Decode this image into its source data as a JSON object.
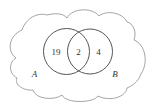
{
  "diagram": {
    "type": "venn",
    "universe_shape": "cloud",
    "colors": {
      "cloud_stroke": "#9a9a9a",
      "circle_stroke": "#555555",
      "text": "#333333",
      "background": "#ffffff"
    },
    "sets": [
      {
        "name": "A",
        "label": "A"
      },
      {
        "name": "B",
        "label": "B"
      }
    ],
    "regions": {
      "a_only": "19",
      "a_and_b": "2",
      "b_only": "4"
    }
  }
}
